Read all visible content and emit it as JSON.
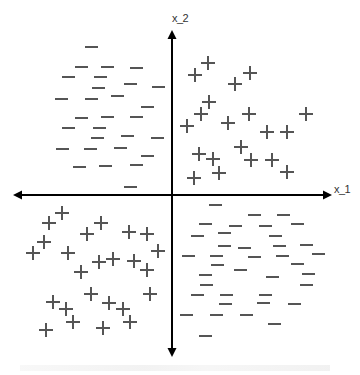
{
  "diagram": {
    "type": "2d-scatter-classification",
    "axes": {
      "x_label": "x_1",
      "y_label": "x_2",
      "origin": [
        172,
        195
      ],
      "x_range_px": [
        13,
        332
      ],
      "y_range_px": [
        30,
        357
      ],
      "color": "#000000"
    },
    "marker_color": "#555555",
    "quadrants": {
      "top_left": {
        "class": "negative",
        "symbol": "−"
      },
      "top_right": {
        "class": "positive",
        "symbol": "+"
      },
      "bottom_left": {
        "class": "positive",
        "symbol": "+"
      },
      "bottom_right": {
        "class": "negative",
        "symbol": "−"
      }
    },
    "plus_points": [
      [
        208,
        63
      ],
      [
        195,
        75
      ],
      [
        250,
        73
      ],
      [
        235,
        84
      ],
      [
        209,
        102
      ],
      [
        201,
        114
      ],
      [
        187,
        126
      ],
      [
        228,
        123
      ],
      [
        249,
        114
      ],
      [
        306,
        114
      ],
      [
        267,
        132
      ],
      [
        287,
        132
      ],
      [
        241,
        147
      ],
      [
        199,
        154
      ],
      [
        213,
        159
      ],
      [
        251,
        160
      ],
      [
        272,
        160
      ],
      [
        219,
        173
      ],
      [
        287,
        172
      ],
      [
        194,
        178
      ],
      [
        62,
        213
      ],
      [
        49,
        223
      ],
      [
        101,
        223
      ],
      [
        87,
        234
      ],
      [
        129,
        232
      ],
      [
        147,
        234
      ],
      [
        44,
        242
      ],
      [
        33,
        253
      ],
      [
        68,
        253
      ],
      [
        158,
        251
      ],
      [
        99,
        262
      ],
      [
        113,
        259
      ],
      [
        134,
        261
      ],
      [
        81,
        272
      ],
      [
        147,
        270
      ],
      [
        91,
        294
      ],
      [
        150,
        294
      ],
      [
        53,
        302
      ],
      [
        109,
        303
      ],
      [
        66,
        309
      ],
      [
        123,
        309
      ],
      [
        73,
        322
      ],
      [
        130,
        322
      ],
      [
        46,
        330
      ],
      [
        103,
        328
      ]
    ],
    "minus_points": [
      [
        91,
        47
      ],
      [
        81,
        67
      ],
      [
        107,
        67
      ],
      [
        136,
        68
      ],
      [
        68,
        77
      ],
      [
        100,
        77
      ],
      [
        98,
        88
      ],
      [
        130,
        84
      ],
      [
        158,
        87
      ],
      [
        61,
        99
      ],
      [
        91,
        99
      ],
      [
        117,
        96
      ],
      [
        147,
        107
      ],
      [
        81,
        118
      ],
      [
        107,
        117
      ],
      [
        136,
        117
      ],
      [
        68,
        128
      ],
      [
        99,
        128
      ],
      [
        97,
        138
      ],
      [
        127,
        136
      ],
      [
        157,
        138
      ],
      [
        62,
        149
      ],
      [
        90,
        149
      ],
      [
        120,
        148
      ],
      [
        147,
        156
      ],
      [
        79,
        167
      ],
      [
        105,
        166
      ],
      [
        136,
        165
      ],
      [
        130,
        187
      ],
      [
        215,
        205
      ],
      [
        254,
        215
      ],
      [
        283,
        215
      ],
      [
        205,
        224
      ],
      [
        235,
        226
      ],
      [
        265,
        226
      ],
      [
        297,
        224
      ],
      [
        197,
        236
      ],
      [
        224,
        233
      ],
      [
        275,
        236
      ],
      [
        224,
        246
      ],
      [
        244,
        248
      ],
      [
        279,
        246
      ],
      [
        306,
        245
      ],
      [
        188,
        256
      ],
      [
        216,
        256
      ],
      [
        254,
        257
      ],
      [
        282,
        256
      ],
      [
        318,
        254
      ],
      [
        217,
        265
      ],
      [
        240,
        270
      ],
      [
        297,
        264
      ],
      [
        205,
        275
      ],
      [
        272,
        277
      ],
      [
        308,
        274
      ],
      [
        206,
        285
      ],
      [
        306,
        285
      ],
      [
        197,
        295
      ],
      [
        226,
        295
      ],
      [
        265,
        295
      ],
      [
        225,
        304
      ],
      [
        263,
        303
      ],
      [
        294,
        304
      ],
      [
        186,
        315
      ],
      [
        216,
        315
      ],
      [
        246,
        315
      ],
      [
        274,
        324
      ],
      [
        205,
        336
      ]
    ]
  }
}
